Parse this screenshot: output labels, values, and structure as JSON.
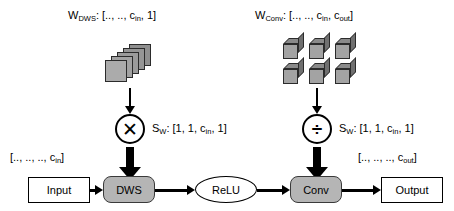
{
  "diagram": {
    "weights": {
      "dws_label": "W_DWS: [.., .., c_in, 1]",
      "conv_label": "W_Conv: [.., .., c_in, c_out]"
    },
    "operators": {
      "multiply_glyph": "✕",
      "multiply_icon": "multiply-icon",
      "divide_glyph": "÷",
      "divide_icon": "divide-icon",
      "scale_dws_label": "S_W: [1, 1, c_in, 1]",
      "scale_conv_label": "S_W: [1, 1, c_in, 1]"
    },
    "shapes": {
      "input_shape": "[.., .., .., c_in]",
      "output_shape": "[.., .., .., c_out]"
    },
    "flow": {
      "input": "Input",
      "dws": "DWS",
      "relu": "ReLU",
      "conv": "Conv",
      "output": "Output"
    },
    "colors": {
      "process_fill": "#b5b5b5",
      "tensor_fill": "#a3a3a3",
      "stroke": "#000000",
      "background": "#ffffff"
    },
    "tensor_icons": {
      "dws_filters": "stacked-squares-icon",
      "dws_filter_count": 5,
      "conv_cubes": "cube-grid-icon",
      "conv_grid_cols": 3,
      "conv_grid_rows": 2
    }
  }
}
